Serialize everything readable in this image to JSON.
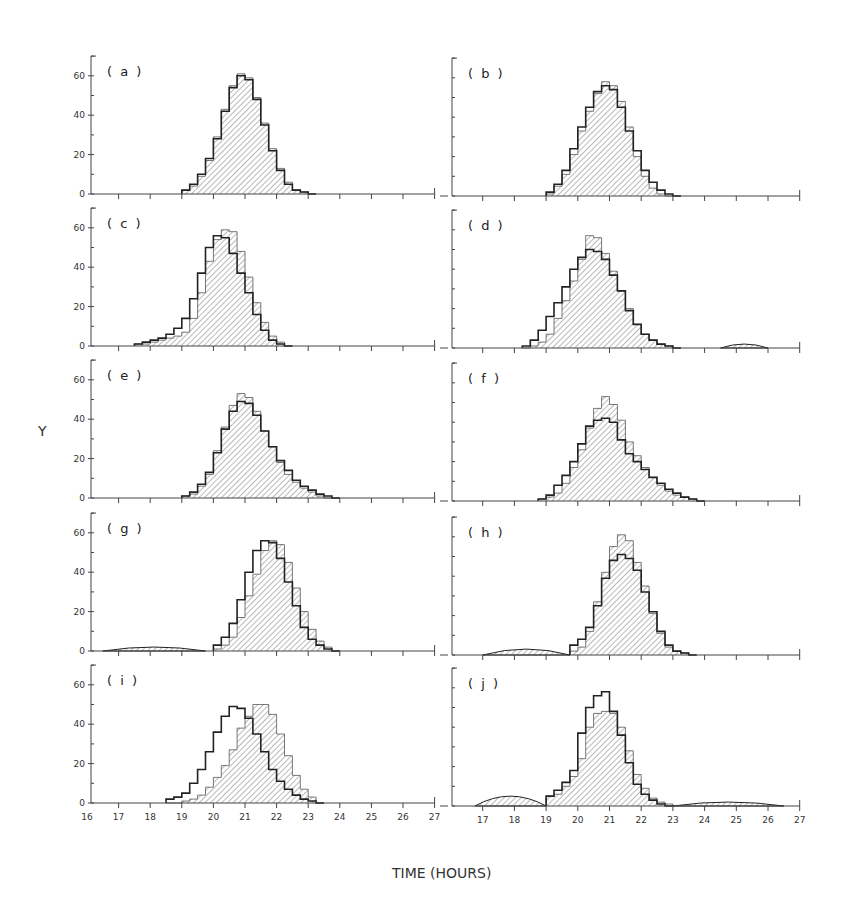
{
  "figure": {
    "xlabel": "TIME (HOURS)",
    "ylabel": "Y",
    "x_ticks": [
      16,
      17,
      18,
      19,
      20,
      21,
      22,
      23,
      24,
      25,
      26,
      27
    ],
    "y_ticks": [
      0,
      20,
      40,
      60
    ],
    "colors": {
      "ink": "#222222",
      "hatch": "#8a8a8a",
      "background": "#ffffff"
    }
  },
  "chart_data": [
    {
      "panel": "(a)",
      "type": "bar",
      "step": true,
      "x_start": 19.0,
      "bin_width": 0.25,
      "xlim": [
        16,
        27
      ],
      "ylim": [
        0,
        70
      ],
      "xlabel": "TIME (HOURS)",
      "ylabel": "Y",
      "series": [
        {
          "name": "open (outline)",
          "values": [
            2,
            5,
            10,
            18,
            28,
            42,
            54,
            60,
            58,
            48,
            35,
            22,
            12,
            5,
            2,
            1,
            0
          ]
        },
        {
          "name": "hatched",
          "values": [
            2,
            4,
            9,
            17,
            29,
            43,
            55,
            61,
            59,
            49,
            36,
            23,
            13,
            6,
            2,
            1,
            0
          ]
        }
      ]
    },
    {
      "panel": "(b)",
      "type": "bar",
      "step": true,
      "x_start": 19.0,
      "bin_width": 0.25,
      "xlim": [
        16,
        27
      ],
      "ylim": [
        0,
        70
      ],
      "series": [
        {
          "name": "open (outline)",
          "values": [
            2,
            6,
            13,
            24,
            35,
            45,
            53,
            56,
            54,
            45,
            33,
            23,
            13,
            7,
            3,
            1,
            0
          ]
        },
        {
          "name": "hatched",
          "values": [
            1,
            5,
            11,
            21,
            33,
            43,
            52,
            58,
            56,
            48,
            35,
            20,
            10,
            4,
            1,
            0,
            0
          ]
        }
      ]
    },
    {
      "panel": "(c)",
      "type": "bar",
      "step": true,
      "x_start": 17.5,
      "bin_width": 0.25,
      "xlim": [
        16,
        27
      ],
      "ylim": [
        0,
        70
      ],
      "series": [
        {
          "name": "open (outline)",
          "values": [
            1,
            2,
            3,
            4,
            6,
            9,
            14,
            24,
            37,
            50,
            56,
            55,
            47,
            37,
            27,
            16,
            8,
            3,
            1,
            0
          ]
        },
        {
          "name": "hatched",
          "values": [
            1,
            1,
            2,
            3,
            4,
            5,
            7,
            14,
            27,
            43,
            54,
            59,
            58,
            48,
            35,
            22,
            12,
            5,
            2,
            0
          ]
        }
      ]
    },
    {
      "panel": "(d)",
      "type": "bar",
      "step": true,
      "x_start": 18.25,
      "bin_width": 0.25,
      "xlim": [
        16,
        27
      ],
      "ylim": [
        0,
        70
      ],
      "series": [
        {
          "name": "open (outline)",
          "values": [
            1,
            4,
            9,
            16,
            23,
            31,
            40,
            46,
            50,
            49,
            45,
            37,
            29,
            19,
            12,
            7,
            4,
            2,
            1,
            0
          ]
        },
        {
          "name": "hatched",
          "values": [
            0,
            1,
            3,
            7,
            15,
            24,
            34,
            45,
            57,
            56,
            48,
            39,
            29,
            20,
            12,
            7,
            4,
            2,
            1,
            0
          ]
        }
      ],
      "secondary_bump": {
        "x_range": [
          24.5,
          26.0
        ],
        "max": 2
      }
    },
    {
      "panel": "(e)",
      "type": "bar",
      "step": true,
      "x_start": 19.0,
      "bin_width": 0.25,
      "xlim": [
        16,
        27
      ],
      "ylim": [
        0,
        70
      ],
      "series": [
        {
          "name": "open (outline)",
          "values": [
            1,
            3,
            7,
            13,
            23,
            35,
            44,
            49,
            48,
            42,
            34,
            26,
            19,
            14,
            9,
            6,
            4,
            2,
            1,
            0
          ]
        },
        {
          "name": "hatched",
          "values": [
            1,
            2,
            6,
            12,
            24,
            36,
            47,
            53,
            51,
            44,
            34,
            26,
            18,
            12,
            8,
            5,
            3,
            1,
            0,
            0
          ]
        }
      ]
    },
    {
      "panel": "(f)",
      "type": "bar",
      "step": true,
      "x_start": 18.75,
      "bin_width": 0.25,
      "xlim": [
        16,
        27
      ],
      "ylim": [
        0,
        70
      ],
      "series": [
        {
          "name": "open (outline)",
          "values": [
            1,
            3,
            8,
            13,
            20,
            29,
            38,
            41,
            42,
            40,
            31,
            24,
            20,
            16,
            12,
            9,
            6,
            4,
            2,
            1,
            0
          ]
        },
        {
          "name": "hatched",
          "values": [
            1,
            2,
            4,
            9,
            17,
            26,
            37,
            47,
            53,
            49,
            41,
            30,
            23,
            17,
            12,
            8,
            5,
            3,
            2,
            1,
            0
          ]
        }
      ]
    },
    {
      "panel": "(g)",
      "type": "bar",
      "step": true,
      "x_start": 20.0,
      "bin_width": 0.25,
      "xlim": [
        16,
        27
      ],
      "ylim": [
        0,
        70
      ],
      "series": [
        {
          "name": "open (outline)",
          "values": [
            3,
            7,
            14,
            26,
            40,
            51,
            56,
            55,
            47,
            35,
            23,
            12,
            6,
            3,
            1,
            0
          ]
        },
        {
          "name": "hatched",
          "values": [
            1,
            3,
            7,
            17,
            28,
            39,
            51,
            56,
            54,
            45,
            32,
            20,
            11,
            5,
            2,
            0
          ]
        }
      ],
      "low_tail": {
        "x_range": [
          16.5,
          19.75
        ],
        "max": 2
      }
    },
    {
      "panel": "(h)",
      "type": "bar",
      "step": true,
      "x_start": 19.75,
      "bin_width": 0.25,
      "xlim": [
        16,
        27
      ],
      "ylim": [
        0,
        70
      ],
      "series": [
        {
          "name": "open (outline)",
          "values": [
            5,
            8,
            14,
            25,
            39,
            48,
            51,
            49,
            43,
            32,
            22,
            12,
            5,
            2,
            1,
            0
          ]
        },
        {
          "name": "hatched",
          "values": [
            2,
            4,
            12,
            27,
            42,
            55,
            61,
            58,
            47,
            35,
            21,
            11,
            4,
            2,
            1,
            0
          ]
        }
      ],
      "low_tail": {
        "x_range": [
          17.0,
          19.75
        ],
        "max": 3
      }
    },
    {
      "panel": "(i)",
      "type": "bar",
      "step": true,
      "x_start": 18.5,
      "bin_width": 0.25,
      "xlim": [
        16,
        27
      ],
      "ylim": [
        0,
        70
      ],
      "series": [
        {
          "name": "open (outline)",
          "values": [
            2,
            3,
            5,
            10,
            17,
            26,
            36,
            44,
            49,
            48,
            43,
            35,
            26,
            17,
            11,
            7,
            4,
            2,
            1,
            0
          ]
        },
        {
          "name": "hatched",
          "values": [
            0,
            0,
            1,
            2,
            4,
            8,
            13,
            19,
            27,
            38,
            44,
            50,
            50,
            45,
            35,
            24,
            14,
            7,
            3,
            0
          ]
        }
      ]
    },
    {
      "panel": "(j)",
      "type": "bar",
      "step": true,
      "x_start": 19.0,
      "bin_width": 0.25,
      "xlim": [
        16,
        27
      ],
      "ylim": [
        0,
        70
      ],
      "series": [
        {
          "name": "open (outline)",
          "values": [
            5,
            8,
            12,
            18,
            37,
            50,
            56,
            58,
            48,
            36,
            22,
            11,
            6,
            3,
            1,
            0
          ]
        },
        {
          "name": "hatched",
          "values": [
            5,
            6,
            10,
            15,
            24,
            40,
            47,
            48,
            47,
            40,
            28,
            16,
            9,
            4,
            2,
            1
          ]
        }
      ],
      "low_tail": {
        "x_range": [
          16.75,
          19.0
        ],
        "max": 5
      },
      "high_tail": {
        "x_range": [
          23.0,
          26.5
        ],
        "max": 2
      }
    }
  ]
}
